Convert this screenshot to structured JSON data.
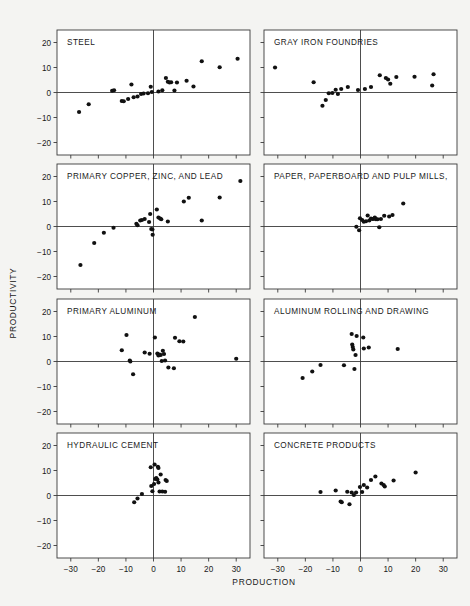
{
  "figure": {
    "xlabel": "PRODUCTION",
    "ylabel": "PRODUCTIVITY",
    "point_color": "#111111",
    "frame_color": "#3a3a3a",
    "background": "#f4f4f2",
    "panel_background": "#ffffff"
  },
  "chart_data": {
    "type": "scatter",
    "title": "",
    "xlabel": "PRODUCTION",
    "ylabel": "PRODUCTIVITY",
    "xlim": [
      -35,
      35
    ],
    "ylim": [
      -25,
      25
    ],
    "xticks": [
      -30,
      -20,
      -10,
      0,
      10,
      20,
      30
    ],
    "yticks": [
      20,
      10,
      0,
      -10,
      -20
    ],
    "xtick_labels": [
      "-30",
      "-20",
      "-10",
      "0",
      "10",
      "20",
      "30"
    ],
    "ytick_labels": [
      "20",
      "10",
      "0",
      "-10",
      "-20"
    ],
    "grid": false,
    "legend": "none",
    "reference_lines": {
      "x": 0,
      "y": 0
    },
    "layout": {
      "rows": 4,
      "cols": 2
    },
    "panels": [
      {
        "id": "steel",
        "title": "STEEL",
        "row": 0,
        "col": 0,
        "points": [
          [
            -27.0,
            -7.8
          ],
          [
            -23.5,
            -4.7
          ],
          [
            -15.0,
            0.7
          ],
          [
            -14.3,
            0.9
          ],
          [
            -11.5,
            -3.4
          ],
          [
            -10.8,
            -3.5
          ],
          [
            -9.2,
            -2.6
          ],
          [
            -8.0,
            3.2
          ],
          [
            -7.2,
            -1.9
          ],
          [
            -5.8,
            -1.6
          ],
          [
            -4.5,
            -0.6
          ],
          [
            -3.6,
            -0.4
          ],
          [
            -2.0,
            -0.3
          ],
          [
            -1.0,
            2.3
          ],
          [
            -0.6,
            0.2
          ],
          [
            1.8,
            0.4
          ],
          [
            3.2,
            0.9
          ],
          [
            4.5,
            5.8
          ],
          [
            5.2,
            4.3
          ],
          [
            5.8,
            4.0
          ],
          [
            6.4,
            4.1
          ],
          [
            7.6,
            0.8
          ],
          [
            8.5,
            4.0
          ],
          [
            12.0,
            4.7
          ],
          [
            14.5,
            2.4
          ],
          [
            17.5,
            12.5
          ],
          [
            24.0,
            10.1
          ],
          [
            30.5,
            13.5
          ]
        ]
      },
      {
        "id": "gray-iron-foundries",
        "title": "GRAY IRON FOUNDRIES",
        "row": 0,
        "col": 1,
        "points": [
          [
            -31.0,
            10.0
          ],
          [
            -17.0,
            4.1
          ],
          [
            -13.8,
            -5.3
          ],
          [
            -12.6,
            -3.0
          ],
          [
            -11.5,
            -0.3
          ],
          [
            -10.2,
            -0.2
          ],
          [
            -9.0,
            1.1
          ],
          [
            -8.2,
            -0.6
          ],
          [
            -7.0,
            1.4
          ],
          [
            -4.6,
            2.2
          ],
          [
            -0.9,
            1.0
          ],
          [
            1.6,
            1.4
          ],
          [
            3.8,
            2.2
          ],
          [
            7.0,
            6.9
          ],
          [
            9.2,
            5.8
          ],
          [
            10.0,
            5.2
          ],
          [
            10.8,
            3.5
          ],
          [
            13.0,
            6.2
          ],
          [
            19.6,
            6.3
          ],
          [
            26.5,
            7.3
          ],
          [
            26.0,
            2.8
          ]
        ]
      },
      {
        "id": "primary-copper-zinc-lead",
        "title": "PRIMARY COPPER, ZINC, AND LEAD",
        "row": 1,
        "col": 0,
        "points": [
          [
            -26.5,
            -15.4
          ],
          [
            -21.5,
            -6.6
          ],
          [
            -18.0,
            -2.5
          ],
          [
            -14.5,
            -0.5
          ],
          [
            -6.2,
            1.1
          ],
          [
            -5.8,
            0.5
          ],
          [
            -4.8,
            2.4
          ],
          [
            -4.2,
            2.6
          ],
          [
            -3.2,
            3.0
          ],
          [
            -1.6,
            1.8
          ],
          [
            -1.2,
            5.0
          ],
          [
            -0.8,
            -1.0
          ],
          [
            -0.4,
            -1.2
          ],
          [
            -0.3,
            -3.3
          ],
          [
            1.2,
            6.8
          ],
          [
            1.8,
            3.6
          ],
          [
            2.4,
            3.2
          ],
          [
            2.8,
            2.9
          ],
          [
            5.2,
            2.0
          ],
          [
            11.0,
            10.0
          ],
          [
            12.8,
            11.5
          ],
          [
            17.5,
            2.4
          ],
          [
            24.0,
            11.6
          ],
          [
            31.5,
            18.2
          ]
        ]
      },
      {
        "id": "paper-paperboard-pulp-mills",
        "title": "PAPER, PAPERBOARD AND PULP MILLS,",
        "row": 1,
        "col": 1,
        "points": [
          [
            -1.5,
            -0.1
          ],
          [
            -0.5,
            -1.5
          ],
          [
            -0.2,
            3.3
          ],
          [
            0.6,
            2.6
          ],
          [
            1.2,
            1.9
          ],
          [
            2.0,
            2.1
          ],
          [
            2.6,
            4.4
          ],
          [
            3.2,
            2.4
          ],
          [
            3.8,
            3.2
          ],
          [
            4.4,
            3.0
          ],
          [
            4.8,
            3.1
          ],
          [
            5.2,
            3.6
          ],
          [
            5.6,
            2.9
          ],
          [
            6.2,
            2.9
          ],
          [
            6.8,
            -0.3
          ],
          [
            7.4,
            3.0
          ],
          [
            8.6,
            4.3
          ],
          [
            10.4,
            4.0
          ],
          [
            11.6,
            4.6
          ],
          [
            15.5,
            9.2
          ]
        ]
      },
      {
        "id": "primary-aluminum",
        "title": "PRIMARY ALUMINUM",
        "row": 2,
        "col": 0,
        "points": [
          [
            -11.5,
            4.5
          ],
          [
            -9.8,
            10.6
          ],
          [
            -8.6,
            0.4
          ],
          [
            -8.4,
            0.0
          ],
          [
            -7.4,
            -5.1
          ],
          [
            -3.2,
            3.6
          ],
          [
            -1.4,
            3.1
          ],
          [
            0.5,
            9.6
          ],
          [
            1.4,
            3.2
          ],
          [
            1.8,
            2.4
          ],
          [
            2.2,
            2.8
          ],
          [
            2.6,
            2.6
          ],
          [
            3.0,
            0.2
          ],
          [
            3.4,
            4.3
          ],
          [
            3.8,
            3.0
          ],
          [
            4.2,
            0.4
          ],
          [
            5.4,
            -2.4
          ],
          [
            7.4,
            -2.7
          ],
          [
            7.8,
            9.5
          ],
          [
            9.4,
            8.1
          ],
          [
            10.8,
            8.0
          ],
          [
            15.0,
            17.8
          ],
          [
            30.0,
            1.1
          ]
        ]
      },
      {
        "id": "aluminum-rolling-and-drawing",
        "title": "ALUMINUM ROLLING AND DRAWING",
        "row": 2,
        "col": 1,
        "points": [
          [
            -21.0,
            -6.6
          ],
          [
            -17.5,
            -4.0
          ],
          [
            -14.5,
            -1.4
          ],
          [
            -6.0,
            -1.5
          ],
          [
            -3.2,
            11.0
          ],
          [
            -3.0,
            6.8
          ],
          [
            -2.8,
            5.8
          ],
          [
            -2.6,
            4.8
          ],
          [
            -1.4,
            10.2
          ],
          [
            -1.8,
            2.6
          ],
          [
            -2.2,
            -3.0
          ],
          [
            1.0,
            9.6
          ],
          [
            1.2,
            5.2
          ],
          [
            3.0,
            5.6
          ],
          [
            13.5,
            5.0
          ]
        ]
      },
      {
        "id": "hydraulic-cement",
        "title": "HYDRAULIC CEMENT",
        "row": 3,
        "col": 0,
        "points": [
          [
            -7.0,
            -2.7
          ],
          [
            -5.8,
            -1.2
          ],
          [
            -4.2,
            0.6
          ],
          [
            -1.0,
            11.3
          ],
          [
            0.4,
            12.4
          ],
          [
            1.6,
            11.5
          ],
          [
            1.8,
            11.0
          ],
          [
            -0.8,
            3.8
          ],
          [
            -0.4,
            1.7
          ],
          [
            0.2,
            4.6
          ],
          [
            0.6,
            6.6
          ],
          [
            1.0,
            7.0
          ],
          [
            1.4,
            6.4
          ],
          [
            1.8,
            5.2
          ],
          [
            2.6,
            8.4
          ],
          [
            2.2,
            1.6
          ],
          [
            3.2,
            1.6
          ],
          [
            4.2,
            1.5
          ],
          [
            4.4,
            6.2
          ],
          [
            4.8,
            5.8
          ]
        ]
      },
      {
        "id": "concrete-products",
        "title": "CONCRETE PRODUCTS",
        "row": 3,
        "col": 1,
        "points": [
          [
            -14.5,
            1.4
          ],
          [
            -9.0,
            2.0
          ],
          [
            -7.2,
            -2.4
          ],
          [
            -6.8,
            -2.7
          ],
          [
            -4.8,
            1.5
          ],
          [
            -4.0,
            -3.5
          ],
          [
            -3.2,
            1.2
          ],
          [
            -2.4,
            0.2
          ],
          [
            -1.6,
            1.2
          ],
          [
            -0.2,
            3.4
          ],
          [
            0.6,
            1.4
          ],
          [
            1.2,
            4.2
          ],
          [
            2.4,
            3.2
          ],
          [
            3.8,
            6.2
          ],
          [
            5.4,
            7.6
          ],
          [
            7.6,
            4.8
          ],
          [
            8.4,
            4.2
          ],
          [
            8.8,
            3.6
          ],
          [
            12.0,
            6.0
          ],
          [
            20.0,
            9.2
          ]
        ]
      }
    ]
  }
}
